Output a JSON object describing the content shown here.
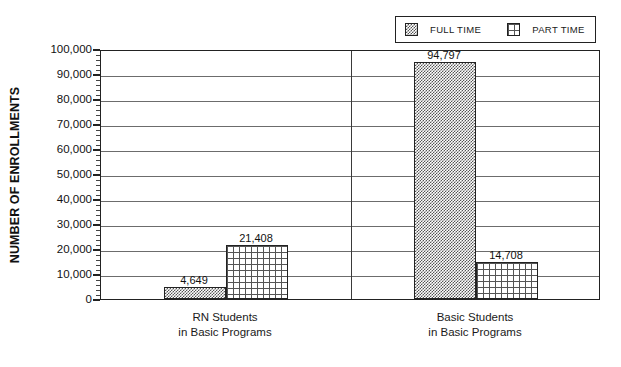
{
  "chart_data": {
    "type": "bar",
    "title": "",
    "subtitle": "",
    "xlabel": "",
    "ylabel": "NUMBER OF ENROLLMENTS",
    "ylim": [
      0,
      100000
    ],
    "ytick_interval": 10000,
    "yminor_interval": 2000,
    "grid": true,
    "grid_axis": "y",
    "legend_position": "top-right",
    "categories": [
      "RN Students\nin Basic Programs",
      "Basic Students\nin Basic Programs"
    ],
    "category_lines": [
      [
        "RN Students",
        "in Basic Programs"
      ],
      [
        "Basic Students",
        "in Basic Programs"
      ]
    ],
    "series": [
      {
        "name": "FULL TIME",
        "pattern": "dark-checkerboard",
        "values": [
          4649,
          94797
        ],
        "value_labels": [
          "4,649",
          "94,797"
        ]
      },
      {
        "name": "PART TIME",
        "pattern": "white-grid",
        "values": [
          21408,
          14708
        ],
        "value_labels": [
          "21,408",
          "14,708"
        ]
      }
    ],
    "ytick_labels": [
      "0",
      "10,000",
      "20,000",
      "30,000",
      "40,000",
      "50,000",
      "60,000",
      "70,000",
      "80,000",
      "90,000",
      "100,000"
    ],
    "colors": {
      "axis": "#222222",
      "gridline": "#6c6c6c",
      "bar_outline": "#222222",
      "full_time_fill": "#555555",
      "part_time_fill": "#ffffff",
      "text": "#1a1a1a",
      "background": "#ffffff"
    }
  },
  "legend": {
    "entries": [
      {
        "label": "FULL TIME",
        "swatch": "full-time-swatch-icon"
      },
      {
        "label": "PART TIME",
        "swatch": "part-time-swatch-icon"
      }
    ]
  },
  "axis": {
    "y_title": "NUMBER OF ENROLLMENTS"
  },
  "caption": {
    "fragment": ""
  }
}
